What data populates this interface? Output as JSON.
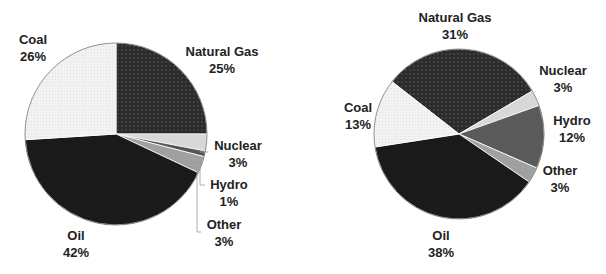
{
  "chart_data": [
    {
      "type": "pie",
      "title": "",
      "categories": [
        "Natural Gas",
        "Nuclear",
        "Hydro",
        "Other",
        "Oil",
        "Coal"
      ],
      "values": [
        25,
        3,
        1,
        3,
        42,
        26
      ],
      "labels": {
        "natural_gas": {
          "name": "Natural Gas",
          "pct": "25%"
        },
        "nuclear": {
          "name": "Nuclear",
          "pct": "3%"
        },
        "hydro": {
          "name": "Hydro",
          "pct": "1%"
        },
        "other": {
          "name": "Other",
          "pct": "3%"
        },
        "oil": {
          "name": "Oil",
          "pct": "42%"
        },
        "coal": {
          "name": "Coal",
          "pct": "26%"
        }
      },
      "start_angle_deg": 0
    },
    {
      "type": "pie",
      "title": "",
      "categories": [
        "Natural Gas",
        "Nuclear",
        "Hydro",
        "Other",
        "Oil",
        "Coal"
      ],
      "values": [
        31,
        3,
        12,
        3,
        38,
        13
      ],
      "labels": {
        "natural_gas": {
          "name": "Natural Gas",
          "pct": "31%"
        },
        "nuclear": {
          "name": "Nuclear",
          "pct": "3%"
        },
        "hydro": {
          "name": "Hydro",
          "pct": "12%"
        },
        "other": {
          "name": "Other",
          "pct": "3%"
        },
        "oil": {
          "name": "Oil",
          "pct": "38%"
        },
        "coal": {
          "name": "Coal",
          "pct": "13%"
        }
      },
      "start_angle_deg": -52
    }
  ],
  "colors": {
    "natural_gas": "#2a2a2a",
    "nuclear": "#d8d8d8",
    "hydro_left": "#555555",
    "hydro_right": "#5a5a5a",
    "other": "#a0a0a0",
    "oil": "#1a1a1a",
    "coal": "#f0f0f0"
  }
}
